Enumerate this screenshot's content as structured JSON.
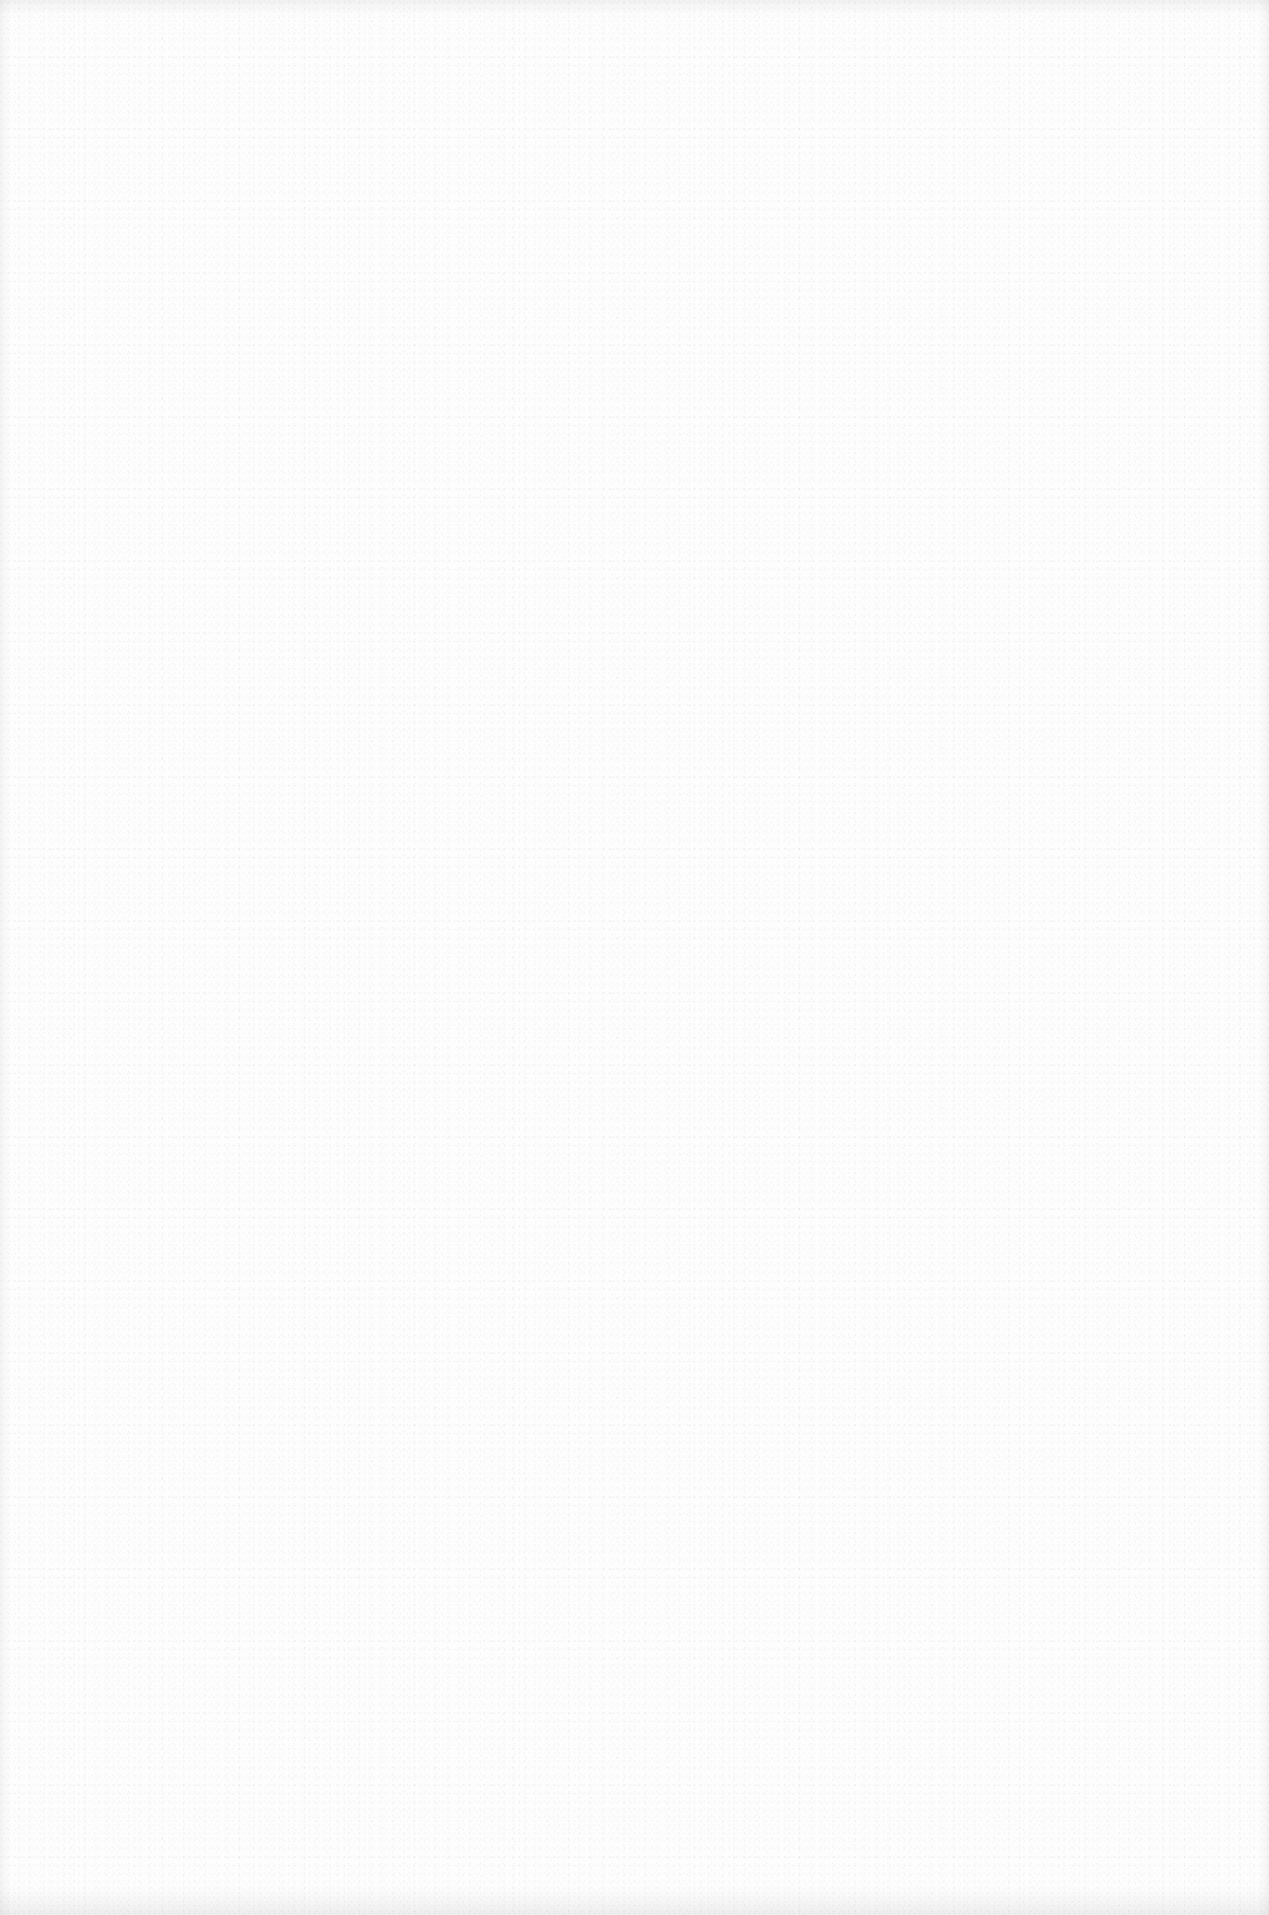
{
  "page": {
    "content": "",
    "background_color": "#fdfdfd"
  }
}
